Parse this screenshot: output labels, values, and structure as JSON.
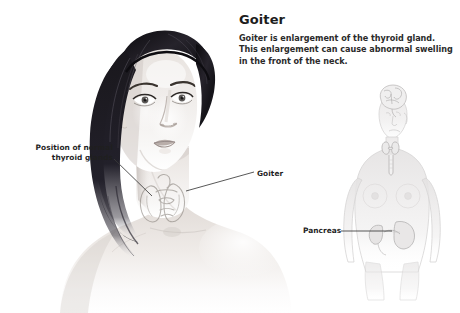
{
  "canvas": {
    "width": 460,
    "height": 313,
    "background": "#ffffff"
  },
  "article": {
    "title": "Goiter",
    "body": "Goiter is enlargement of the thyroid gland. This enlargement can cause abnormal swelling in the front of the neck."
  },
  "callouts": {
    "normal_thyroid": {
      "line1": "Position of normal",
      "line2": "thyroid glands"
    },
    "goiter": "Goiter",
    "pancreas": "Pancreas"
  },
  "illustration": {
    "portrait": "grayscale-portrait-woman-with-long-dark-hair-bare-shoulders",
    "overlay": "butterfly-shaped-enlarged-thyroid-gland-outline-on-neck",
    "anatomy_figure": "pale-female-torso-showing-brain-thyroid-and-pancreas"
  },
  "colors": {
    "text": "#1d1d1d",
    "body_text": "#2a2a2a",
    "leader_line": "#3a3a3a",
    "skin_light": "#f4f2f0",
    "skin_mid": "#dcd7d4",
    "skin_shadow": "#b9b2ae",
    "hair_dark": "#16151a",
    "hair_mid": "#3b3740",
    "anatomy_pale": "#e7e6e6"
  }
}
